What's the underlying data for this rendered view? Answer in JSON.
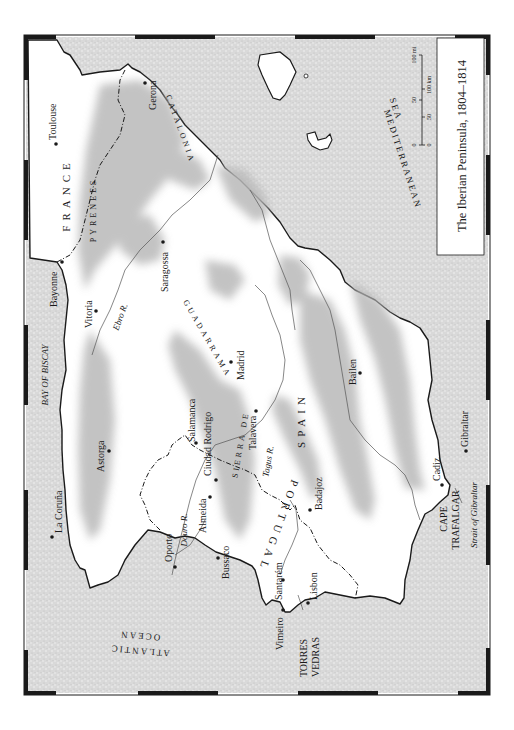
{
  "map": {
    "title": "The Iberian Peninsula, 1804–1814",
    "orientation": "rotated 90° clockwise (north points left)",
    "colors": {
      "sea_fill": "#d6d6d6",
      "land_fill": "#ffffff",
      "mountain_shade": "#b4b4b4",
      "coastline": "#1a1a1a",
      "border_frame": "#1a1a1a"
    },
    "scale_bar": {
      "miles_labels": [
        "0",
        "50",
        "100 mi"
      ],
      "km_labels": [
        "0",
        "50",
        "100 km"
      ]
    },
    "countries": {
      "france": "FRANCE",
      "spain": "SPAIN",
      "portugal": "PORTUGAL"
    },
    "regions": {
      "pyrenees": "PYRENEES",
      "catalonia": "CATALONIA",
      "guadarrama": "GUADARRAMA",
      "sierra_de": "SIERRA DE"
    },
    "seas": {
      "bay_of_biscay": "BAY OF BISCAY",
      "atlantic": "ATLANTIC",
      "ocean": "OCEAN",
      "mediterranean": "MEDITERRANEAN",
      "sea": "SEA",
      "strait": "Strait of Gibraltar"
    },
    "rivers": {
      "ebro": "Ebro R.",
      "douro": "Douro R.",
      "tagus": "Tagus R."
    },
    "capes": {
      "trafalgar_1": "CAPE",
      "trafalgar_2": "TRAFALGAR",
      "torres_1": "TORRES",
      "torres_2": "VEDRAS"
    },
    "cities": [
      {
        "name": "Toulouse"
      },
      {
        "name": "Gerona"
      },
      {
        "name": "Bayonne"
      },
      {
        "name": "Vitoria"
      },
      {
        "name": "Saragossa"
      },
      {
        "name": "Madrid"
      },
      {
        "name": "Salamanca"
      },
      {
        "name": "Astorga"
      },
      {
        "name": "La Coruña"
      },
      {
        "name": "Ciudad Rodrigo"
      },
      {
        "name": "Almeida"
      },
      {
        "name": "Talavera"
      },
      {
        "name": "Oporto"
      },
      {
        "name": "Bussaco"
      },
      {
        "name": "Badajoz"
      },
      {
        "name": "Bailen"
      },
      {
        "name": "Santarém"
      },
      {
        "name": "Lisbon"
      },
      {
        "name": "Vimeiro"
      },
      {
        "name": "Cadiz"
      },
      {
        "name": "Gibraltar"
      }
    ]
  }
}
